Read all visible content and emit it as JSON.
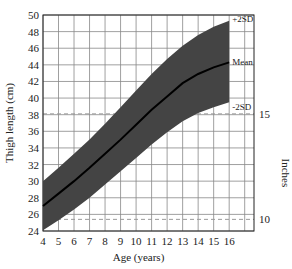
{
  "chart_data": {
    "type": "area",
    "title": "",
    "xlabel": "Age (years)",
    "ylabel": "Thigh length (cm)",
    "y2label": "Inches",
    "xlim": [
      4,
      17.6
    ],
    "ylim": [
      24,
      50
    ],
    "x_ticks": [
      4,
      5,
      6,
      7,
      8,
      9,
      10,
      11,
      12,
      13,
      14,
      15,
      16
    ],
    "y_ticks": [
      24,
      26,
      28,
      30,
      32,
      34,
      36,
      38,
      40,
      42,
      44,
      46,
      48,
      50
    ],
    "y2_ticks": [
      {
        "label": "15",
        "cm": 38.1
      },
      {
        "label": "10",
        "cm": 25.4
      }
    ],
    "grid": true,
    "x": [
      4,
      5,
      6,
      7,
      8,
      9,
      10,
      11,
      12,
      13,
      14,
      15,
      16
    ],
    "series": [
      {
        "name": "+2SD",
        "values": [
          30,
          31.6,
          33.3,
          35,
          36.9,
          38.9,
          40.9,
          42.9,
          44.7,
          46.3,
          47.6,
          48.6,
          49.3
        ]
      },
      {
        "name": "Mean",
        "values": [
          27,
          28.5,
          30,
          31.6,
          33.3,
          35,
          36.8,
          38.6,
          40.2,
          41.8,
          42.9,
          43.7,
          44.3
        ]
      },
      {
        "name": "-2SD",
        "values": [
          24.1,
          25.3,
          26.6,
          28,
          29.6,
          31.2,
          32.8,
          34.4,
          35.9,
          37.2,
          38.2,
          38.9,
          39.5
        ]
      }
    ],
    "annotations": [
      "+2SD",
      "Mean",
      "-2SD"
    ]
  }
}
